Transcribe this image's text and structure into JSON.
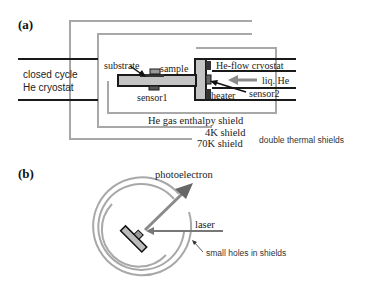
{
  "panel_a": {
    "label": "(a)",
    "closed_cycle_line1": "closed cycle",
    "closed_cycle_line2": "He cryostat",
    "substrate": "substrate",
    "sample": "sample",
    "sensor1": "sensor1",
    "he_flow_cryostat": "He-flow cryostat",
    "liq_he": "liq. He",
    "heater": "heater",
    "sensor2": "sensor2",
    "he_gas_shield": "He gas enthalpy shield",
    "shield_4k": "4K shield",
    "shield_70k": "70K shield",
    "double_shields": "double thermal shields"
  },
  "panel_b": {
    "label": "(b)",
    "photoelectron": "photoelectron",
    "laser": "laser",
    "small_holes": "small holes in shields"
  },
  "colors": {
    "shield_gray": "#a8a8a8",
    "dark": "#1a1a1a",
    "rod_fill": "#c4c4c4",
    "arrow_gray": "#8a8a8a",
    "arrow_dark": "#666666"
  }
}
